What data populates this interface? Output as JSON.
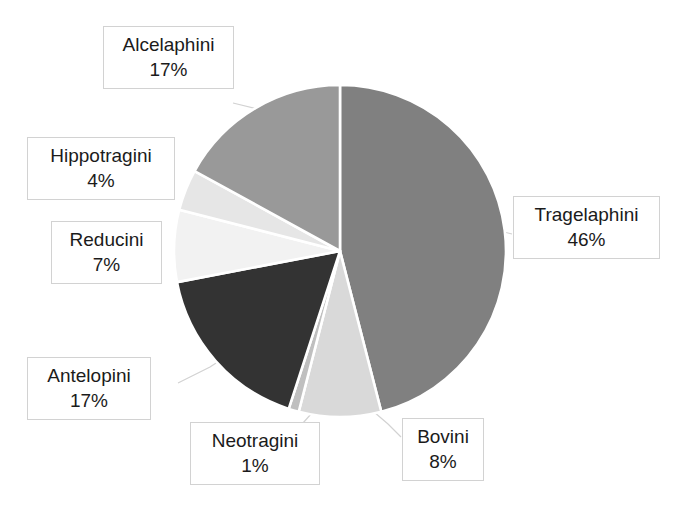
{
  "chart_data": {
    "type": "pie",
    "title": "formation",
    "xlabel": "",
    "ylabel": "",
    "legend": "none",
    "grid": false,
    "labels_format": "name + percent",
    "categories": [
      "Tragelaphini",
      "Bovini",
      "Neotragini",
      "Antelopini",
      "Reducini",
      "Hippotragini",
      "Alcelaphini"
    ],
    "values": [
      46,
      8,
      1,
      17,
      7,
      4,
      17
    ],
    "value_labels": [
      "46%",
      "8%",
      "1%",
      "17%",
      "7%",
      "4%",
      "17%"
    ],
    "colors": [
      "#808080",
      "#d9d9d9",
      "#bfbfbf",
      "#333333",
      "#f2f2f2",
      "#e6e6e6",
      "#999999"
    ],
    "start_angle_deg": 0,
    "direction": "clockwise",
    "slices": [
      {
        "name": "Tragelaphini",
        "value": 46,
        "label": "46%",
        "color": "#808080",
        "start_deg": 0,
        "end_deg": 165.6
      },
      {
        "name": "Bovini",
        "value": 8,
        "label": "8%",
        "color": "#d9d9d9",
        "start_deg": 165.6,
        "end_deg": 194.4
      },
      {
        "name": "Neotragini",
        "value": 1,
        "label": "1%",
        "color": "#bfbfbf",
        "start_deg": 194.4,
        "end_deg": 198.0
      },
      {
        "name": "Antelopini",
        "value": 17,
        "label": "17%",
        "color": "#333333",
        "start_deg": 198.0,
        "end_deg": 259.2
      },
      {
        "name": "Reducini",
        "value": 7,
        "label": "7%",
        "color": "#f2f2f2",
        "start_deg": 259.2,
        "end_deg": 284.4
      },
      {
        "name": "Hippotragini",
        "value": 4,
        "label": "4%",
        "color": "#e6e6e6",
        "start_deg": 284.4,
        "end_deg": 298.8
      },
      {
        "name": "Alcelaphini",
        "value": 17,
        "label": "17%",
        "color": "#999999",
        "start_deg": 298.8,
        "end_deg": 360.0
      }
    ]
  },
  "callouts": {
    "alcelaphini": {
      "name": "Alcelaphini",
      "pct": "17%"
    },
    "hippotragini": {
      "name": "Hippotragini",
      "pct": "4%"
    },
    "reducini": {
      "name": "Reducini",
      "pct": "7%"
    },
    "antelopini": {
      "name": "Antelopini",
      "pct": "17%"
    },
    "neotragini": {
      "name": "Neotragini",
      "pct": "1%"
    },
    "bovini": {
      "name": "Bovini",
      "pct": "8%"
    },
    "tragelaphini": {
      "name": "Tragelaphini",
      "pct": "46%"
    }
  }
}
